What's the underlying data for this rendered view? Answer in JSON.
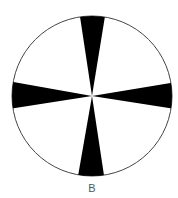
{
  "figure": {
    "label": "B",
    "circle": {
      "cx": 92,
      "cy": 96,
      "r": 80,
      "stroke": "#444444",
      "fill": "#ffffff"
    },
    "wedges": [
      {
        "name": "top",
        "points": "92,96 80,15 105,15"
      },
      {
        "name": "bottom",
        "points": "92,96 78,176 104,176"
      },
      {
        "name": "left",
        "points": "92,96 12,82 12,108"
      },
      {
        "name": "right",
        "points": "92,96 171,83 171,108"
      }
    ],
    "wedge_color": "#000000"
  }
}
